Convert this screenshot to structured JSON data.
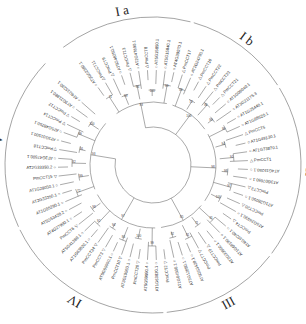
{
  "figure": {
    "type": "circular-phylogenetic-tree",
    "center": [
      153,
      165
    ],
    "leaf_radius": 95,
    "label_radius": 97,
    "arc_radius": 148,
    "markers": {
      "circle": "○",
      "triangle_up": "△",
      "triangle_down": "▽"
    }
  },
  "clades": [
    {
      "id": "Ia",
      "label": "I a",
      "angle": 335
    },
    {
      "id": "Ib",
      "label": "I b",
      "angle": 22
    },
    {
      "id": "II",
      "label": "II",
      "angle": 128
    },
    {
      "id": "III",
      "label": "III",
      "angle": 182
    },
    {
      "id": "IV",
      "label": "IV",
      "angle": 246
    },
    {
      "id": "V",
      "label": "V",
      "angle": 305
    }
  ],
  "leaves": [
    {
      "name": "AT3G02380.1",
      "marker": "circle",
      "clade": "Ia"
    },
    {
      "name": "PmCCT11",
      "marker": "triangle_up",
      "clade": "Ia"
    },
    {
      "name": "PmCCT9",
      "marker": "triangle_up",
      "clade": "Ia"
    },
    {
      "name": "AT5G48250.1",
      "marker": "circle",
      "clade": "Ia"
    },
    {
      "name": "PmCCT13",
      "marker": "triangle_up",
      "clade": "Ia"
    },
    {
      "name": "AT2G47890.1",
      "marker": "circle",
      "clade": "Ia"
    },
    {
      "name": "PmCCT8",
      "marker": "triangle_up",
      "clade": "Ia"
    },
    {
      "name": "AT5G15850.1",
      "marker": "circle",
      "clade": "Ia"
    },
    {
      "name": "AT5G15840.1",
      "marker": "circle",
      "clade": "Ia"
    },
    {
      "name": "AT4G39070.1",
      "marker": "circle",
      "clade": "Ia"
    },
    {
      "name": "PmCCT17",
      "marker": "triangle_up",
      "clade": "Ib"
    },
    {
      "name": "AT2G24790.1",
      "marker": "circle",
      "clade": "Ib"
    },
    {
      "name": "PmCCT16",
      "marker": "triangle_up",
      "clade": "Ib"
    },
    {
      "name": "PmCCT22",
      "marker": "triangle_up",
      "clade": "Ib"
    },
    {
      "name": "PmCCT23",
      "marker": "triangle_up",
      "clade": "Ib"
    },
    {
      "name": "PmCCT21",
      "marker": "triangle_up",
      "clade": "Ib"
    },
    {
      "name": "AT1G06040.1",
      "marker": "circle",
      "clade": "Ib"
    },
    {
      "name": "AT3G21175.3",
      "marker": "circle",
      "clade": "Ib"
    },
    {
      "name": "AT1G25440.1",
      "marker": "circle",
      "clade": "II"
    },
    {
      "name": "AT1G68520.1",
      "marker": "circle",
      "clade": "II"
    },
    {
      "name": "PmCCT5",
      "marker": "triangle_up",
      "clade": "II"
    },
    {
      "name": "AT1G49130.1",
      "marker": "circle",
      "clade": "II"
    },
    {
      "name": "AT1G73870.1",
      "marker": "circle",
      "clade": "II"
    },
    {
      "name": "PmCCT1",
      "marker": "triangle_up",
      "clade": "II"
    },
    {
      "name": "AT4G15250.1",
      "marker": "circle",
      "clade": "II"
    },
    {
      "name": "AT3G07650.1",
      "marker": "circle",
      "clade": "II"
    },
    {
      "name": "PmCCT3",
      "marker": "triangle_up",
      "clade": "II"
    },
    {
      "name": "AT1G28050.1",
      "marker": "circle",
      "clade": "II"
    },
    {
      "name": "PmCCT20",
      "marker": "triangle_up",
      "clade": "II"
    },
    {
      "name": "AT5G24930.1",
      "marker": "circle",
      "clade": "II"
    },
    {
      "name": "PmCCT4",
      "marker": "triangle_up",
      "clade": "II"
    },
    {
      "name": "AT4G10240.1",
      "marker": "circle",
      "clade": "III"
    },
    {
      "name": "AT1G68190.1",
      "marker": "circle",
      "clade": "III"
    },
    {
      "name": "AT2G33500.1",
      "marker": "circle",
      "clade": "III"
    },
    {
      "name": "PmCCT19",
      "marker": "triangle_up",
      "clade": "III"
    },
    {
      "name": "PmCCT7",
      "marker": "triangle_down",
      "clade": "III"
    },
    {
      "name": "AT5G53420.1",
      "marker": "circle",
      "clade": "III"
    },
    {
      "name": "AT3G12890.1",
      "marker": "circle",
      "clade": "III"
    },
    {
      "name": "AT1G04500.1",
      "marker": "circle",
      "clade": "III"
    },
    {
      "name": "PmCCT2",
      "marker": "triangle_down",
      "clade": "III"
    },
    {
      "name": "AT1G63820.1",
      "marker": "circle",
      "clade": "IV"
    },
    {
      "name": "AT5G59990.4",
      "marker": "circle",
      "clade": "IV"
    },
    {
      "name": "PmCCT26",
      "marker": "triangle_down",
      "clade": "IV"
    },
    {
      "name": "AT3G10060.1",
      "marker": "circle",
      "clade": "IV"
    },
    {
      "name": "PmCCT10",
      "marker": "triangle_down",
      "clade": "IV"
    },
    {
      "name": "AT5G59990.1",
      "marker": "circle",
      "clade": "IV"
    },
    {
      "name": "PmCCT3",
      "marker": "triangle_down",
      "clade": "IV"
    },
    {
      "name": "PmCCT24",
      "marker": "triangle_down",
      "clade": "IV"
    },
    {
      "name": "AT1G63820.1",
      "marker": "circle",
      "clade": "IV"
    },
    {
      "name": "AT5G41380.1",
      "marker": "circle",
      "clade": "IV"
    },
    {
      "name": "PmCCT6",
      "marker": "triangle_down",
      "clade": "IV"
    },
    {
      "name": "AT4G27900.1",
      "marker": "circle",
      "clade": "IV"
    },
    {
      "name": "AT5G53420.2",
      "marker": "circle",
      "clade": "IV"
    },
    {
      "name": "AT1G05290.1",
      "marker": "circle",
      "clade": "V"
    },
    {
      "name": "AT2G33350.1",
      "marker": "circle",
      "clade": "V"
    },
    {
      "name": "AT1G28050.1",
      "marker": "circle",
      "clade": "V"
    },
    {
      "name": "PmCCT15",
      "marker": "triangle_down",
      "clade": "V"
    },
    {
      "name": "AT2G33350.2",
      "marker": "circle",
      "clade": "V"
    },
    {
      "name": "AT3G47500.1",
      "marker": "circle",
      "clade": "V"
    },
    {
      "name": "PmCCT18",
      "marker": "triangle_down",
      "clade": "V"
    },
    {
      "name": "AT3G01500.1",
      "marker": "circle",
      "clade": "V"
    },
    {
      "name": "AT5G48250.1",
      "marker": "circle",
      "clade": "V"
    },
    {
      "name": "PmCCT14",
      "marker": "triangle_down",
      "clade": "V"
    },
    {
      "name": "PmCCT12",
      "marker": "triangle_down",
      "clade": "V"
    },
    {
      "name": "AT3G21880.1",
      "marker": "circle",
      "clade": "V"
    },
    {
      "name": "AT4G15230.1",
      "marker": "circle",
      "clade": "V"
    }
  ],
  "bootstrap_values": [
    "71",
    "99",
    "96",
    "100",
    "99",
    "93",
    "83",
    "72",
    "86",
    "99",
    "100",
    "99",
    "94",
    "91",
    "98",
    "97",
    "100",
    "98",
    "91",
    "71",
    "81",
    "92",
    "85",
    "99",
    "100",
    "86",
    "94",
    "92",
    "98",
    "97",
    "72",
    "99",
    "82",
    "91",
    "99",
    "100",
    "93",
    "88",
    "97",
    "86",
    "91",
    "75",
    "100",
    "96",
    "99",
    "100",
    "98",
    "81",
    "96",
    "64",
    "72",
    "96",
    "100",
    "88",
    "100",
    "99",
    "94",
    "97"
  ],
  "arc_span_deg": [
    250,
    400
  ]
}
